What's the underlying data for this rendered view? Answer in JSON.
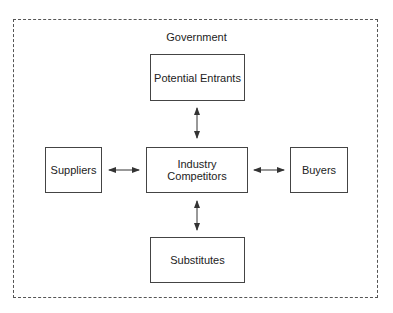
{
  "diagram": {
    "title": "Government",
    "nodes": {
      "potential_entrants": "Potential Entrants",
      "suppliers": "Suppliers",
      "industry_competitors": "Industry Competitors",
      "buyers": "Buyers",
      "substitutes": "Substitutes"
    },
    "edges": [
      {
        "from": "Potential Entrants",
        "to": "Industry Competitors",
        "type": "bidirectional"
      },
      {
        "from": "Suppliers",
        "to": "Industry Competitors",
        "type": "bidirectional"
      },
      {
        "from": "Industry Competitors",
        "to": "Buyers",
        "type": "bidirectional"
      },
      {
        "from": "Industry Competitors",
        "to": "Substitutes",
        "type": "bidirectional"
      }
    ],
    "boundary": "dashed",
    "colors": {
      "line": "#444444",
      "text": "#222222",
      "background": "#ffffff"
    }
  }
}
